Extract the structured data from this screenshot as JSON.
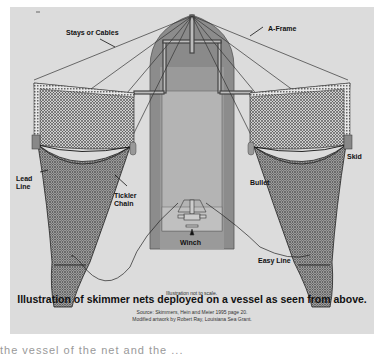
{
  "labels": {
    "stays": "Stays or Cables",
    "aframe": "A-Frame",
    "lead_line_1": "Lead",
    "lead_line_2": "Line",
    "tickler_1": "Tickler",
    "tickler_2": "Chain",
    "bullet": "Bullet",
    "skid": "Skid",
    "winch": "Winch",
    "easy_line": "Easy Line",
    "scale_note": "Illustration not to scale."
  },
  "caption": {
    "title": "Illustration of skimmer nets deployed on a vessel as seen from above.",
    "source_line1": "Source: Skimmers, Hein and Meier 1995 page 20.",
    "source_line2": "Modified artwork by Robert Ray, Louisiana Sea Grant."
  },
  "colors": {
    "figure_bg": "#dcdcdc",
    "hull": "#8c8c8c",
    "deck": "#b4b4b4",
    "net": "#555555",
    "line": "#222222"
  },
  "truncated_text": "the vessel of the net and the ..."
}
